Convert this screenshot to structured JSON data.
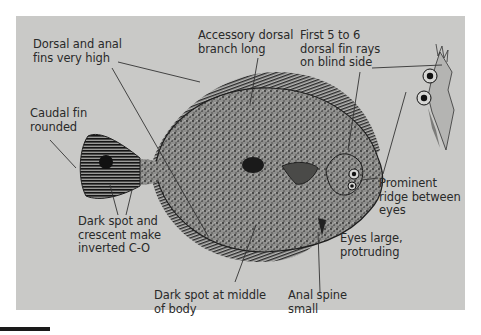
{
  "figure": {
    "colors": {
      "panel_background": "#c9c9c7",
      "ink": "#1e1e1e",
      "label_text": "#2a2a2a",
      "leader_line": "#333333"
    }
  },
  "labels": {
    "dorsal_anal_fins": "Dorsal and anal\nfins very high",
    "accessory_dorsal": "Accessory dorsal\nbranch long",
    "first_rays": "First 5 to 6\ndorsal fin rays\non blind side",
    "caudal_fin": "Caudal fin\nrounded",
    "prominent_ridge": "Prominent\nridge between\neyes",
    "dark_spot_crescent": "Dark spot and\ncrescent make\ninverted C-O",
    "eyes_large": "Eyes large,\nprotruding",
    "dark_spot_middle": "Dark spot at middle\nof body",
    "anal_spine": "Anal spine\nsmall"
  }
}
